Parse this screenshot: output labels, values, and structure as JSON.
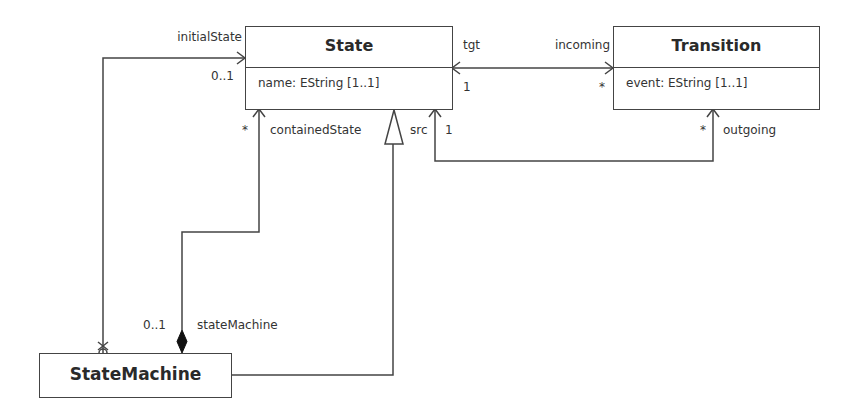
{
  "diagram": {
    "type": "UML class diagram",
    "classes": [
      {
        "id": "State",
        "name": "State",
        "attributes": [
          "name: EString [1..1]"
        ]
      },
      {
        "id": "Transition",
        "name": "Transition",
        "attributes": [
          "event: EString [1..1]"
        ]
      },
      {
        "id": "StateMachine",
        "name": "StateMachine",
        "attributes": []
      }
    ],
    "associations": {
      "initial_state": {
        "role": "initialState",
        "multiplicity": "0..1",
        "from": "StateMachine",
        "to": "State",
        "navigable": true
      },
      "tgt_incoming": {
        "tgt_role": "tgt",
        "tgt_multiplicity": "1",
        "incoming_role": "incoming",
        "incoming_multiplicity": "*"
      },
      "src_outgoing": {
        "src_role": "src",
        "src_multiplicity": "1",
        "outgoing_role": "outgoing",
        "outgoing_multiplicity": "*"
      },
      "containment": {
        "contained_role": "containedState",
        "contained_multiplicity": "*",
        "container_role": "stateMachine",
        "container_multiplicity": "0..1",
        "kind": "composition"
      }
    },
    "generalization": {
      "child": "StateMachine",
      "parent": "State"
    }
  },
  "colors": {
    "line": "#444444",
    "text": "#333333",
    "background": "#ffffff"
  }
}
